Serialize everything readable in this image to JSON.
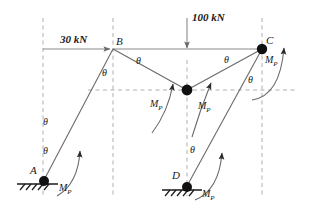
{
  "figure": {
    "background_color": "#ffffff",
    "line_color": "#5a5a5a",
    "node_color": "#111111",
    "text_color": "#1a1a1a",
    "dash_color": "#9a9a9a"
  },
  "loads": [
    {
      "id": "horizontal-load",
      "label": "30 kN",
      "magnitude": 30,
      "unit": "kN",
      "direction": "right"
    },
    {
      "id": "vertical-load",
      "label": "100 kN",
      "magnitude": 100,
      "unit": "kN",
      "direction": "down"
    }
  ],
  "nodes": [
    {
      "id": "A",
      "label": "A",
      "type": "fixed-support",
      "solid": true
    },
    {
      "id": "B",
      "label": "B",
      "type": "joint",
      "solid": false
    },
    {
      "id": "C",
      "label": "C",
      "type": "joint",
      "solid": true
    },
    {
      "id": "D",
      "label": "D",
      "type": "fixed-support",
      "solid": true
    },
    {
      "id": "E",
      "label": "",
      "type": "hinge",
      "solid": true
    }
  ],
  "plastic_hinges": [
    {
      "id": "mp-at-a",
      "label": "M",
      "sub": "P",
      "at": "A"
    },
    {
      "id": "mp-at-center-left",
      "label": "M",
      "sub": "P",
      "at": "E"
    },
    {
      "id": "mp-at-center-right",
      "label": "M",
      "sub": "P",
      "at": "E"
    },
    {
      "id": "mp-at-c",
      "label": "M",
      "sub": "P",
      "at": "C"
    },
    {
      "id": "mp-at-d",
      "label": "M",
      "sub": "P",
      "at": "D"
    }
  ],
  "rotations": [
    {
      "id": "theta-a-upper",
      "label": "θ",
      "at": "A"
    },
    {
      "id": "theta-a-lower",
      "label": "θ",
      "at": "A"
    },
    {
      "id": "theta-b-below",
      "label": "θ",
      "at": "B"
    },
    {
      "id": "theta-b-right",
      "label": "θ",
      "at": "B"
    },
    {
      "id": "theta-c-left",
      "label": "θ",
      "at": "C"
    },
    {
      "id": "theta-c-below",
      "label": "θ",
      "at": "C"
    },
    {
      "id": "theta-d",
      "label": "θ",
      "at": "D"
    }
  ]
}
